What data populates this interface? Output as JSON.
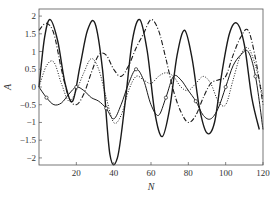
{
  "chart_data": {
    "type": "line",
    "title": "",
    "xlabel": "N",
    "ylabel": "A",
    "xlim": [
      0,
      120
    ],
    "ylim": [
      -2.2,
      2.2
    ],
    "x_ticks": [
      20,
      40,
      60,
      80,
      100,
      120
    ],
    "y_ticks": [
      -2,
      -1.5,
      -1,
      -0.5,
      0,
      0.5,
      1,
      1.5,
      2
    ],
    "x_tick_labels": [
      "20",
      "40",
      "60",
      "80",
      "100",
      "120"
    ],
    "y_tick_labels": [
      "-2",
      "-1.5",
      "-1",
      "-0.5",
      "0",
      "0.5",
      "1",
      "1.5",
      "2"
    ],
    "grid": false,
    "legend": null,
    "series": [
      {
        "name": "solid-thick",
        "style": "solid",
        "x": [
          0,
          3,
          6,
          10,
          14,
          18,
          22,
          26,
          30,
          34,
          38,
          42,
          46,
          50,
          54,
          58,
          62,
          66,
          70,
          74,
          78,
          82,
          86,
          90,
          94,
          98,
          102,
          106,
          110,
          114,
          118
        ],
        "values": [
          0.0,
          1.4,
          1.9,
          1.3,
          0.1,
          -0.4,
          0.6,
          1.6,
          1.8,
          0.5,
          -1.9,
          -2.0,
          -0.5,
          1.3,
          1.9,
          1.0,
          -0.7,
          -1.4,
          -0.6,
          0.9,
          1.6,
          0.8,
          -0.6,
          -1.3,
          -1.0,
          0.4,
          1.5,
          1.8,
          1.2,
          -0.3,
          -1.2
        ]
      },
      {
        "name": "dash-dot",
        "style": "dashdot",
        "x": [
          0,
          4,
          8,
          12,
          16,
          20,
          24,
          28,
          32,
          36,
          40,
          44,
          48,
          52,
          56,
          60,
          64,
          68,
          72,
          76,
          80,
          84,
          88,
          92,
          96,
          100,
          104,
          108,
          112,
          116,
          120
        ],
        "values": [
          1.6,
          1.8,
          1.5,
          0.5,
          -0.3,
          -0.5,
          -0.2,
          0.4,
          0.9,
          0.9,
          0.5,
          0.3,
          0.6,
          1.1,
          1.5,
          1.9,
          1.6,
          0.8,
          -0.1,
          -0.7,
          -1.0,
          -0.8,
          -0.3,
          0.1,
          0.2,
          0.3,
          0.9,
          1.4,
          1.6,
          0.8,
          -0.5
        ]
      },
      {
        "name": "dotted",
        "style": "dotted",
        "x": [
          0,
          4,
          8,
          12,
          16,
          20,
          24,
          28,
          32,
          36,
          40,
          44,
          48,
          52,
          56,
          60,
          64,
          68,
          72,
          76,
          80,
          84,
          88,
          92,
          96,
          100,
          104,
          108,
          112,
          116,
          120
        ],
        "values": [
          0.0,
          0.6,
          0.7,
          0.1,
          -0.4,
          -0.1,
          0.4,
          0.8,
          0.5,
          -0.3,
          -1.0,
          -0.8,
          -0.1,
          0.3,
          0.2,
          0.1,
          0.3,
          0.4,
          0.3,
          0.0,
          -0.1,
          0.1,
          0.3,
          0.1,
          -0.4,
          -0.5,
          0.2,
          0.9,
          1.1,
          0.6,
          -0.3
        ]
      },
      {
        "name": "solid-marked",
        "style": "solid-with-circles",
        "x": [
          0,
          4,
          8,
          12,
          16,
          20,
          24,
          28,
          32,
          36,
          40,
          44,
          48,
          52,
          56,
          60,
          64,
          68,
          72,
          76,
          80,
          84,
          88,
          92,
          96,
          100,
          104,
          108,
          112,
          116,
          120
        ],
        "values": [
          0.0,
          -0.3,
          -0.5,
          -0.45,
          -0.2,
          0.0,
          -0.1,
          -0.3,
          -0.4,
          -0.6,
          -0.9,
          -0.5,
          0.1,
          0.5,
          0.2,
          -0.5,
          -0.8,
          -0.3,
          0.3,
          0.2,
          -0.1,
          -0.4,
          -0.8,
          -0.9,
          -0.6,
          0.0,
          0.6,
          0.9,
          1.0,
          0.3,
          -1.2
        ]
      }
    ]
  }
}
